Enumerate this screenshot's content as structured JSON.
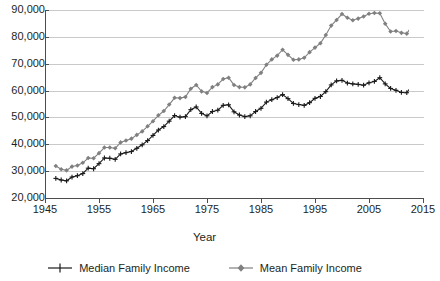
{
  "chart_data": {
    "type": "line",
    "title": "",
    "xlabel": "Year",
    "ylabel": "",
    "xlim": [
      1945,
      2015
    ],
    "ylim": [
      20000,
      90000
    ],
    "grid": true,
    "legend_position": "bottom",
    "x_tick_labels": [
      "1945",
      "1955",
      "1965",
      "1975",
      "1985",
      "1995",
      "2005",
      "2015"
    ],
    "x_ticks": [
      1945,
      1955,
      1965,
      1975,
      1985,
      1995,
      2005,
      2015
    ],
    "y_tick_labels": [
      "90,000",
      "80,000",
      "70,000",
      "60,000",
      "50,000",
      "40,000",
      "30,000",
      "20,000"
    ],
    "y_ticks": [
      90000,
      80000,
      70000,
      60000,
      50000,
      40000,
      30000,
      20000
    ],
    "x": [
      1947,
      1948,
      1949,
      1950,
      1951,
      1952,
      1953,
      1954,
      1955,
      1956,
      1957,
      1958,
      1959,
      1960,
      1961,
      1962,
      1963,
      1964,
      1965,
      1966,
      1967,
      1968,
      1969,
      1970,
      1971,
      1972,
      1973,
      1974,
      1975,
      1976,
      1977,
      1978,
      1979,
      1980,
      1981,
      1982,
      1983,
      1984,
      1985,
      1986,
      1987,
      1988,
      1989,
      1990,
      1991,
      1992,
      1993,
      1994,
      1995,
      1996,
      1997,
      1998,
      1999,
      2000,
      2001,
      2002,
      2003,
      2004,
      2005,
      2006,
      2007,
      2008,
      2009,
      2010,
      2011,
      2012,
      2013
    ],
    "series": [
      {
        "name": "Median Family Income",
        "marker": "plus",
        "color": "#1a1a1a",
        "values": [
          27300,
          26700,
          26400,
          27800,
          28300,
          29100,
          31100,
          30900,
          32800,
          34900,
          34800,
          34400,
          36400,
          36900,
          37300,
          38500,
          39800,
          41400,
          43300,
          45300,
          46600,
          48600,
          50700,
          50100,
          50300,
          52900,
          53900,
          51500,
          50600,
          52200,
          52700,
          54500,
          54700,
          52100,
          50900,
          50300,
          50600,
          52200,
          53400,
          55700,
          56600,
          57400,
          58500,
          57000,
          55200,
          54800,
          54500,
          55500,
          57100,
          57800,
          59600,
          62100,
          63600,
          63800,
          62800,
          62500,
          62300,
          62000,
          62900,
          63400,
          64800,
          62500,
          60800,
          60100,
          59300,
          59200,
          62000
        ]
      },
      {
        "name": "Mean Family Income",
        "marker": "diamond",
        "color": "#808080",
        "values": [
          31900,
          30700,
          30300,
          31700,
          32100,
          33100,
          34900,
          34800,
          36700,
          38800,
          38800,
          38500,
          40700,
          41400,
          42100,
          43500,
          44800,
          46700,
          48600,
          50800,
          52400,
          54800,
          57300,
          57200,
          57600,
          60700,
          62100,
          59700,
          59100,
          61300,
          62300,
          64300,
          64800,
          62100,
          61300,
          61200,
          62300,
          64700,
          66600,
          69600,
          71600,
          73000,
          75200,
          73300,
          71500,
          71600,
          72200,
          74300,
          76000,
          77600,
          80700,
          84200,
          86300,
          88500,
          87100,
          86200,
          86800,
          87600,
          88600,
          88900,
          88800,
          84900,
          82000,
          82200,
          81500,
          81200,
          84200
        ]
      }
    ]
  },
  "axis_titles": {
    "x": "Year"
  },
  "legend": {
    "entries": [
      {
        "label": "Median Family Income",
        "icon": "plus-marker-icon",
        "color": "#1a1a1a"
      },
      {
        "label": "Mean Family Income",
        "icon": "diamond-marker-icon",
        "color": "#808080"
      }
    ]
  },
  "colors": {
    "median_series": "#1a1a1a",
    "mean_series": "#808080",
    "gridline": "#c9c9c9",
    "axis": "#4d4d4d",
    "background": "#ffffff"
  }
}
